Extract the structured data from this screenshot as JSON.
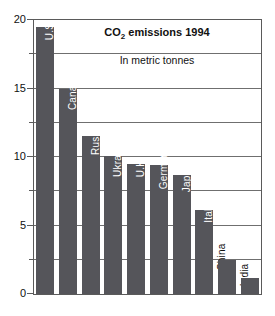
{
  "chart_data": {
    "type": "bar",
    "title": "CO2 emissions 1994",
    "title_prefix": "CO",
    "title_subscript": "2",
    "title_suffix": " emissions 1994",
    "subtitle": "In metric tonnes",
    "xlabel": "",
    "ylabel": "",
    "ylim": [
      0,
      20
    ],
    "yticks": [
      0,
      5,
      10,
      15,
      20
    ],
    "ytick_labels": [
      "0",
      "5",
      "10",
      "15",
      "20"
    ],
    "minor_yticks": [
      2.5,
      7.5,
      12.5,
      17.5
    ],
    "gridlines": [
      2.5,
      5,
      7.5,
      10,
      12.5,
      15,
      17.5
    ],
    "grid": true,
    "legend": "none",
    "categories": [
      "U.S.",
      "Canada",
      "Russia",
      "Ukraine",
      "U.K.",
      "Germany",
      "Japan",
      "Italy",
      "China",
      "India"
    ],
    "values": [
      19.5,
      15.0,
      11.5,
      10.1,
      9.5,
      9.4,
      8.7,
      6.1,
      2.5,
      1.2
    ],
    "label_placement": [
      "inside",
      "inside",
      "inside",
      "inside",
      "inside",
      "inside",
      "inside",
      "inside",
      "outside",
      "outside"
    ],
    "bar_color": "#55555a",
    "inside_label_color": "#ffffff",
    "outside_label_color": "#111111",
    "background_color": "#ffffff",
    "axis_color": "#5a5a5a"
  }
}
